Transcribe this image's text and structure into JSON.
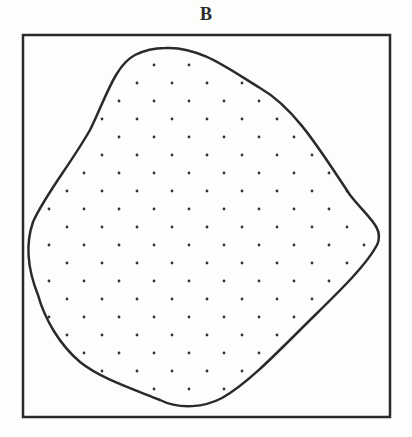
{
  "figure": {
    "title": "B",
    "colors": {
      "ink": "#2a2a2a",
      "background": "#fdfdfb",
      "dot": "#333333"
    },
    "frame": {
      "x": 23,
      "y": 35,
      "width": 367,
      "height": 382,
      "stroke_width": 2.5
    },
    "blob": {
      "description": "Closed irregular rounded shape filled with a staggered dot pattern",
      "stroke_width": 2.5,
      "path": "M 165 48 C 200 46 230 70 260 88 C 295 108 320 150 350 195 C 368 218 385 228 377 245 C 365 268 330 300 300 330 C 270 360 245 385 222 398 C 205 407 180 410 160 400 C 130 388 100 378 80 362 C 60 345 45 320 38 295 C 28 270 25 245 33 222 C 45 195 70 165 90 130 C 105 100 115 65 135 55 C 145 50 155 48 165 48 Z"
    },
    "dot_pattern": {
      "spacing_x": 35,
      "spacing_y": 18,
      "row_start_y": 65,
      "rows": 19,
      "even_row_start_x": 49,
      "odd_row_start_x": 67,
      "columns": 10,
      "radius": 1.4
    }
  }
}
